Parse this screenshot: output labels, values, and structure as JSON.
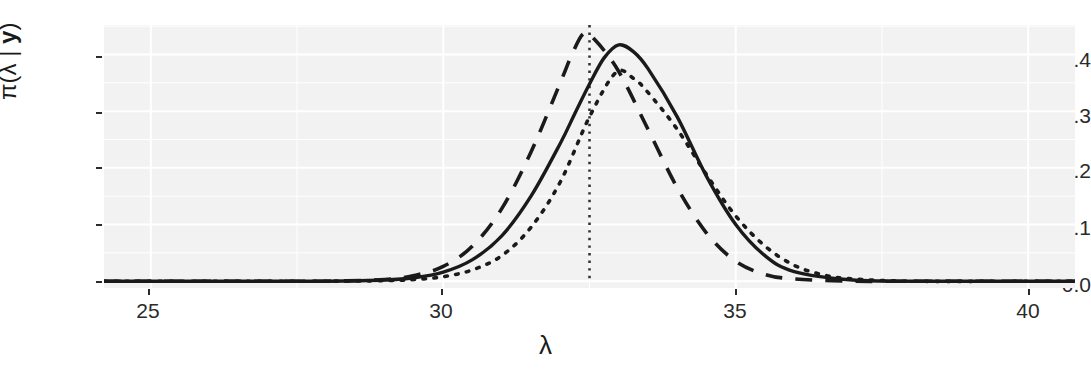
{
  "chart_data": {
    "type": "line",
    "title": "",
    "subtitle": "",
    "xlabel": "λ",
    "ylabel": "π(λ | y)",
    "ylabel_parts": {
      "prefix": "π(λ | ",
      "bold": "y",
      "suffix": ")"
    },
    "xlim": [
      24.2,
      40.8
    ],
    "ylim": [
      -0.012,
      0.452
    ],
    "xticks": [
      25,
      30,
      35,
      40
    ],
    "xticklabels": [
      "25",
      "30",
      "35",
      "40"
    ],
    "yticks": [
      0.0,
      0.1,
      0.2,
      0.3,
      0.4
    ],
    "yticklabels": [
      "0.0",
      "0.1",
      "0.2",
      "0.3",
      "0.4"
    ],
    "grid": true,
    "grid_color": "#ffffff",
    "panel_color": "#f2f2f2",
    "legend": "none",
    "annotations": [
      {
        "name": "posterior-mode-reference-line",
        "type": "vline",
        "x": 32.5,
        "style": "dotted",
        "color": "#333333"
      }
    ],
    "series": [
      {
        "name": "solid-density",
        "style": "solid",
        "color": "#1a1a1a",
        "mode": 32.75,
        "peak": 0.417,
        "sd": 0.97,
        "x": [
          24.2,
          25,
          26,
          27,
          28,
          29,
          29.5,
          30,
          30.5,
          31,
          31.5,
          32,
          32.25,
          32.5,
          32.75,
          33,
          33.25,
          33.5,
          34,
          34.5,
          35,
          35.5,
          36,
          37,
          38,
          40,
          40.8
        ],
        "y": [
          0.0,
          0.0,
          0.0,
          0.0,
          0.0,
          0.002,
          0.006,
          0.016,
          0.038,
          0.08,
          0.15,
          0.243,
          0.296,
          0.348,
          0.394,
          0.417,
          0.405,
          0.375,
          0.29,
          0.185,
          0.1,
          0.045,
          0.017,
          0.002,
          0.0,
          0.0,
          0.0
        ]
      },
      {
        "name": "dashed-density",
        "style": "dashed",
        "color": "#1a1a1a",
        "mode": 32.4,
        "peak": 0.437,
        "sd": 0.93,
        "x": [
          24.2,
          25,
          26,
          27,
          28,
          29,
          29.5,
          30,
          30.5,
          31,
          31.5,
          32,
          32.2,
          32.4,
          32.6,
          33,
          33.5,
          34,
          34.5,
          35,
          35.5,
          36,
          37,
          38,
          40,
          40.8
        ],
        "y": [
          0.0,
          0.0,
          0.0,
          0.0,
          0.0,
          0.003,
          0.01,
          0.026,
          0.062,
          0.128,
          0.228,
          0.35,
          0.4,
          0.437,
          0.425,
          0.37,
          0.268,
          0.165,
          0.085,
          0.035,
          0.012,
          0.004,
          0.0,
          0.0,
          0.0,
          0.0
        ]
      },
      {
        "name": "dotted-density",
        "style": "dotted",
        "color": "#1a1a1a",
        "mode": 32.95,
        "peak": 0.368,
        "sd": 1.14,
        "x": [
          24.2,
          25,
          26,
          27,
          28,
          29,
          29.5,
          30,
          30.5,
          31,
          31.5,
          32,
          32.5,
          32.95,
          33.25,
          33.5,
          34,
          34.5,
          35,
          35.5,
          36,
          36.5,
          37,
          38,
          40,
          40.8
        ],
        "y": [
          0.0,
          0.0,
          0.0,
          0.0,
          0.0,
          0.001,
          0.003,
          0.008,
          0.02,
          0.045,
          0.095,
          0.175,
          0.29,
          0.368,
          0.358,
          0.333,
          0.268,
          0.188,
          0.115,
          0.062,
          0.028,
          0.011,
          0.004,
          0.0,
          0.0,
          0.0
        ]
      }
    ]
  },
  "axes": {
    "y_title_prefix": "π(λ | ",
    "y_title_bold": "y",
    "y_title_suffix": ")",
    "x_title": "λ",
    "x_tick_labels": [
      "25",
      "30",
      "35",
      "40"
    ],
    "y_tick_labels": [
      "0.0",
      "0.1",
      "0.2",
      "0.3",
      "0.4"
    ]
  }
}
